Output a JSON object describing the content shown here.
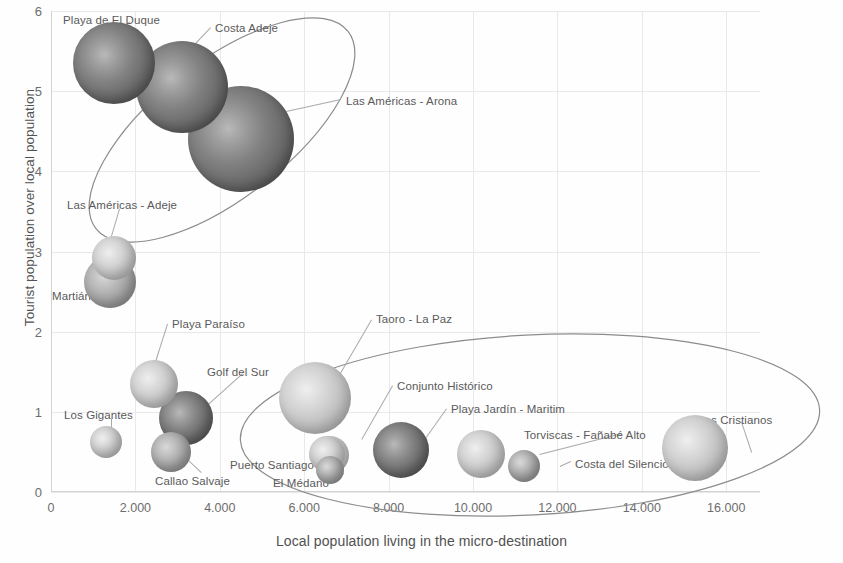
{
  "chart_data": {
    "type": "scatter",
    "title": "",
    "xlabel": "Local population living in the micro-destination",
    "ylabel": "Tourist population over local population",
    "xlim": [
      0,
      16800
    ],
    "ylim": [
      0,
      6
    ],
    "xticks": [
      "0",
      "2.000",
      "4.000",
      "6.000",
      "8.000",
      "10.000",
      "12.000",
      "14.000",
      "16.000"
    ],
    "xtick_values": [
      0,
      2000,
      4000,
      6000,
      8000,
      10000,
      12000,
      14000,
      16000
    ],
    "yticks": [
      "0",
      "1",
      "2",
      "3",
      "4",
      "5",
      "6"
    ],
    "ytick_values": [
      0,
      1,
      2,
      3,
      4,
      5,
      6
    ],
    "grid": true,
    "legend": "none",
    "bubble_size_meaning": "tourist beds / accommodation capacity",
    "points": [
      {
        "label": "Playa de El Duque",
        "x": 1500,
        "y": 5.35,
        "r": 41,
        "shade": "dark",
        "lx": 63,
        "ly": 14,
        "anchor": "left",
        "leader": {
          "x1": 130,
          "y1": 22,
          "x2": 116,
          "y2": 40
        }
      },
      {
        "label": "Costa Adeje",
        "x": 3100,
        "y": 5.05,
        "r": 46,
        "shade": "dark",
        "lx": 215,
        "ly": 22,
        "anchor": "left",
        "leader": {
          "x1": 211,
          "y1": 28,
          "x2": 192,
          "y2": 48
        }
      },
      {
        "label": "Las Américas - Arona",
        "x": 4500,
        "y": 4.4,
        "r": 53,
        "shade": "dark",
        "lx": 346,
        "ly": 95,
        "anchor": "left",
        "leader": {
          "x1": 341,
          "y1": 100,
          "x2": 286,
          "y2": 112
        }
      },
      {
        "label": "Las Américas - Adeje",
        "x": 1500,
        "y": 2.92,
        "r": 22,
        "shade": "light",
        "lx": 67,
        "ly": 199,
        "anchor": "left",
        "leader": {
          "x1": 120,
          "y1": 209,
          "x2": 110,
          "y2": 243
        }
      },
      {
        "label": "Martiánez",
        "x": 1400,
        "y": 2.62,
        "r": 26,
        "shade": "mid",
        "lx": 52,
        "ly": 290,
        "anchor": "left",
        "leader": {
          "x1": 103,
          "y1": 293,
          "x2": 110,
          "y2": 270
        }
      },
      {
        "label": "Playa Paraíso",
        "x": 2450,
        "y": 1.35,
        "r": 24,
        "shade": "light",
        "lx": 172,
        "ly": 318,
        "anchor": "left",
        "leader": {
          "x1": 168,
          "y1": 324,
          "x2": 156,
          "y2": 362
        }
      },
      {
        "label": "Golf del Sur",
        "x": 3200,
        "y": 0.92,
        "r": 27,
        "shade": "dark",
        "lx": 207,
        "ly": 366,
        "anchor": "left",
        "leader": {
          "x1": 243,
          "y1": 374,
          "x2": 205,
          "y2": 408
        }
      },
      {
        "label": "Los Gigantes",
        "x": 1300,
        "y": 0.62,
        "r": 16,
        "shade": "light",
        "lx": 64,
        "ly": 409,
        "anchor": "left",
        "leader": {
          "x1": 112,
          "y1": 419,
          "x2": 112,
          "y2": 428
        }
      },
      {
        "label": "Callao Salvaje",
        "x": 2850,
        "y": 0.5,
        "r": 20,
        "shade": "mid",
        "lx": 155,
        "ly": 475,
        "anchor": "left",
        "leader": {
          "x1": 201,
          "y1": 473,
          "x2": 182,
          "y2": 455
        }
      },
      {
        "label": "Taoro - La Paz",
        "x": 6250,
        "y": 1.17,
        "r": 36,
        "shade": "light",
        "lx": 376,
        "ly": 313,
        "anchor": "left",
        "leader": {
          "x1": 372,
          "y1": 320,
          "x2": 336,
          "y2": 382
        }
      },
      {
        "label": "Puerto Santiago",
        "x": 6550,
        "y": 0.47,
        "r": 18,
        "shade": "light",
        "lx": 230,
        "ly": 459,
        "anchor": "left",
        "leader": {
          "x1": 312,
          "y1": 463,
          "x2": 336,
          "y2": 455
        }
      },
      {
        "label": "El Médano",
        "x": 6600,
        "y": 0.28,
        "r": 14,
        "shade": "mid",
        "lx": 273,
        "ly": 477,
        "anchor": "left",
        "leader": {
          "x1": 332,
          "y1": 479,
          "x2": 344,
          "y2": 473
        }
      },
      {
        "label": "Conjunto Histórico",
        "x": 6600,
        "y": 0.46,
        "r": 19,
        "shade": "light",
        "lx": 397,
        "ly": 380,
        "anchor": "left",
        "leader": {
          "x1": 393,
          "y1": 386,
          "x2": 362,
          "y2": 440
        }
      },
      {
        "label": "Playa Jardín - Maritim",
        "x": 8300,
        "y": 0.52,
        "r": 28,
        "shade": "dark",
        "lx": 451,
        "ly": 403,
        "anchor": "left",
        "leader": {
          "x1": 447,
          "y1": 409,
          "x2": 425,
          "y2": 440
        }
      },
      {
        "label": "Torviscas - Fañabé Alto",
        "x": 10200,
        "y": 0.47,
        "r": 24,
        "shade": "light",
        "lx": 524,
        "ly": 429,
        "anchor": "left",
        "leader": {
          "x1": 622,
          "y1": 434,
          "x2": 540,
          "y2": 455
        }
      },
      {
        "label": "Costa del Silencio",
        "x": 11200,
        "y": 0.33,
        "r": 16,
        "shade": "mid",
        "lx": 575,
        "ly": 458,
        "anchor": "left",
        "leader": {
          "x1": 571,
          "y1": 462,
          "x2": 560,
          "y2": 467
        }
      },
      {
        "label": "Los Cristianos",
        "x": 15250,
        "y": 0.55,
        "r": 33,
        "shade": "light",
        "lx": 698,
        "ly": 414,
        "anchor": "left",
        "leader": {
          "x1": 742,
          "y1": 422,
          "x2": 752,
          "y2": 452
        }
      }
    ],
    "annotations": [
      {
        "name": "upper-cluster-ellipse",
        "shape": "ellipse",
        "cx": 222,
        "cy": 130,
        "rx": 160,
        "ry": 68,
        "rotation": -38
      },
      {
        "name": "lower-cluster-ellipse",
        "shape": "ellipse",
        "cx": 530,
        "cy": 425,
        "rx": 290,
        "ry": 90,
        "rotation": -3
      }
    ]
  }
}
